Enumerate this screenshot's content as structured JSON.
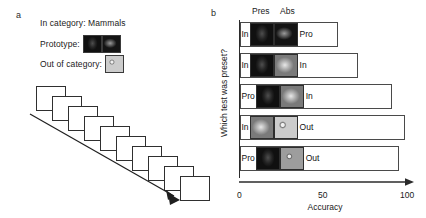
{
  "figure": {
    "panel_a_letter": "a",
    "panel_b_letter": "b"
  },
  "panel_a": {
    "category_line": "In category: Mammals",
    "prototype_label": "Prototype:",
    "out_of_category_label": "Out of category:",
    "prototype_thumbs": [
      "deer-light-thumb",
      "deer-dark-thumb"
    ],
    "out_of_category_thumbs": [
      "owl-thumb"
    ],
    "sequence_note": "rsvp-image-stream-arrow",
    "sequence_frames": [
      "scene-dark-frame",
      "scene-mid-frame",
      "blank-frame",
      "panda-frame",
      "blank-frame",
      "scene-dark-frame",
      "grass-frame",
      "bird-frame",
      "cow-frame",
      "wheel-frame"
    ]
  },
  "chart_data": {
    "type": "bar",
    "title": "",
    "orientation": "horizontal",
    "xlabel": "Accuracy",
    "ylabel": "Which test was preset?",
    "xlim": [
      0,
      100
    ],
    "xticks": [
      "0",
      "50",
      "100"
    ],
    "xtick_values": [
      0,
      50,
      100
    ],
    "grid": false,
    "legend": "none",
    "column_headers": [
      "Pres",
      "Abs"
    ],
    "categories": [
      "In / Pro",
      "In / In",
      "Pro / In",
      "In / Out",
      "Pro / Out"
    ],
    "values": [
      58,
      70,
      90,
      98,
      94
    ],
    "rows": [
      {
        "left_label": "In",
        "right_label": "Pro",
        "present_thumb": "deer-light-thumb",
        "absent_thumb": "deer-dark-thumb",
        "value": 58
      },
      {
        "left_label": "In",
        "right_label": "In",
        "present_thumb": "deer-light-thumb",
        "absent_thumb": "dog-thumb",
        "value": 70
      },
      {
        "left_label": "Pro",
        "right_label": "In",
        "present_thumb": "lion-thumb",
        "absent_thumb": "dog-thumb",
        "value": 90
      },
      {
        "left_label": "In",
        "right_label": "Out",
        "present_thumb": "deer-light-thumb",
        "absent_thumb": "owl-thumb",
        "value": 98
      },
      {
        "left_label": "Pro",
        "right_label": "Out",
        "present_thumb": "lion-thumb",
        "absent_thumb": "monkey-thumb",
        "value": 94
      }
    ]
  }
}
